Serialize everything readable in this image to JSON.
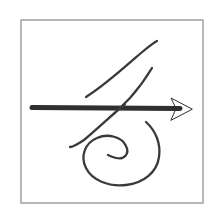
{
  "image": {
    "title": "Hand-drawn arrow and spiral sketch",
    "width": 219,
    "height": 219,
    "background_color": "#ffffff"
  },
  "frame": {
    "name": "sketch-border",
    "x": 21,
    "y": 20,
    "width": 182,
    "height": 183,
    "stroke_color": "#9a9a9a",
    "stroke_width": 1.4,
    "fill_color": "#ffffff"
  },
  "sketch": {
    "ink_color": "#2b2b2b",
    "strokes": [
      {
        "name": "arrow-shaft",
        "type": "line",
        "path": "M 32 107.5 L 180 108.5",
        "stroke_width": 5.0,
        "color": "#2f2f2f"
      },
      {
        "name": "arrow-head",
        "type": "polygon",
        "points": "192,109 171,98 176,108.5 171,120",
        "color": "#2f2f2f"
      },
      {
        "name": "long-diagonal-curve",
        "type": "curve",
        "path": "M 86 97 C 104 86 126 66 141 53 C 147 48 153 43 157 41",
        "stroke_width": 2.3,
        "color": "#3a3a3a"
      },
      {
        "name": "short-hook-curve",
        "type": "curve",
        "path": "M 152 68 C 146 78 138 89 130 98 C 126 102 124 104 122 106",
        "stroke_width": 2.3,
        "color": "#3a3a3a"
      },
      {
        "name": "lower-diagonal-curve",
        "type": "curve",
        "path": "M 125 104 C 112 115 96 130 84 140 C 78 144 73 147 70 147",
        "stroke_width": 2.3,
        "color": "#3a3a3a"
      },
      {
        "name": "spiral-curve",
        "type": "spiral",
        "path": "M 146 122 C 156 131 161 144 159 157 C 157 172 144 183 126 185 C 108 187 92 180 86 168 C 80 156 85 143 97 138 C 108 133 122 137 126 146 C 130 154 124 160 116 158 C 112 157 110 156 108 155",
        "stroke_width": 2.3,
        "color": "#3a3a3a",
        "turns": 1.8,
        "center": [
          118,
          155
        ]
      }
    ]
  }
}
